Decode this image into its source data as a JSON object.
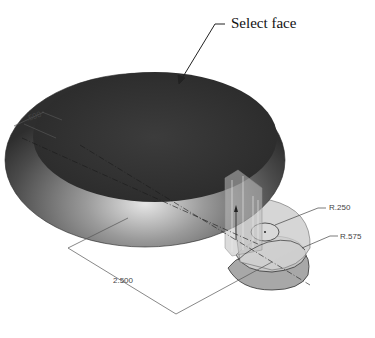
{
  "figure": {
    "callout": {
      "label": "Select face"
    },
    "dimensions": {
      "offset": ".500",
      "length": "2.500",
      "inner_radius": "R.250",
      "outer_radius": "R.575"
    },
    "colors": {
      "top_face": "#3a3a3a",
      "torus_body": "#6e6e6e",
      "handle_face": "#d0d0d0",
      "dimension_line": "#555555",
      "callout_line": "#222222"
    }
  }
}
